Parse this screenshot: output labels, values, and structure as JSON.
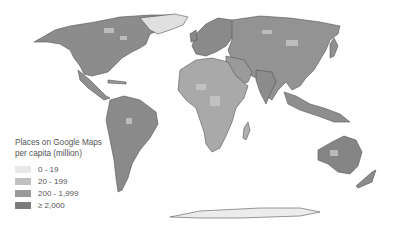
{
  "legend": {
    "title_line1": "Places on Google Maps",
    "title_line2": "per capita (million)",
    "items": [
      {
        "label": "0 - 19",
        "color": "#e8e8e8"
      },
      {
        "label": "20 - 199",
        "color": "#c0c0c0"
      },
      {
        "label": "200 - 1,999",
        "color": "#9a9a9a"
      },
      {
        "label": "≥ 2,000",
        "color": "#7b7b7b"
      }
    ]
  },
  "colors": {
    "land_high": "#7b7b7b",
    "land_mid": "#9a9a9a",
    "land_low": "#c0c0c0",
    "land_lowest": "#e8e8e8",
    "border": "#555555",
    "ocean": "#ffffff"
  }
}
